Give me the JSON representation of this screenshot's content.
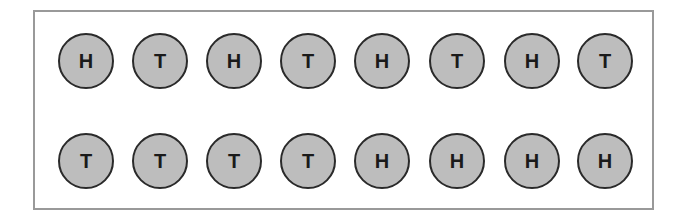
{
  "rows": [
    {
      "coins": [
        "H",
        "T",
        "H",
        "T",
        "H",
        "T",
        "H",
        "T"
      ]
    },
    {
      "coins": [
        "T",
        "T",
        "T",
        "T",
        "H",
        "H",
        "H",
        "H"
      ]
    }
  ],
  "colors": {
    "coin_fill": "#bdbdbd",
    "coin_stroke": "#2a2a2a",
    "frame": "#999999"
  }
}
